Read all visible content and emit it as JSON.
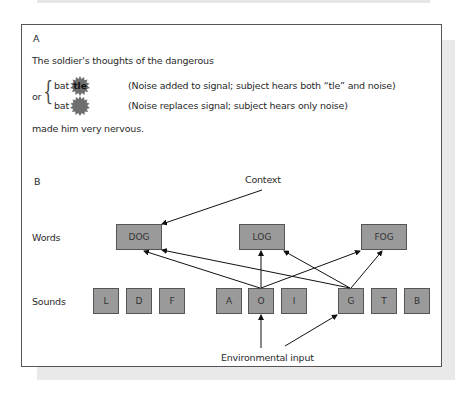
{
  "panel_a": {
    "label": "A",
    "sentence_start": "The soldier's thoughts of the dangerous",
    "or_label": "or",
    "options": [
      {
        "word_stem": "bat",
        "noise_text": "tle",
        "description": "(Noise added to signal; subject hears both “tle” and noise)"
      },
      {
        "word_stem": "bat",
        "noise_text": "",
        "description": "(Noise replaces signal; subject hears only noise)"
      }
    ],
    "sentence_end": "made him very nervous."
  },
  "panel_b": {
    "label": "B",
    "context_label": "Context",
    "words_row_label": "Words",
    "sounds_row_label": "Sounds",
    "input_label": "Environmental input",
    "words": [
      "DOG",
      "LOG",
      "FOG"
    ],
    "sounds": [
      "L",
      "D",
      "F",
      "A",
      "O",
      "I",
      "G",
      "T",
      "B"
    ],
    "connections": [
      {
        "from": "Context",
        "to": "DOG"
      },
      {
        "from": "O",
        "to": "DOG"
      },
      {
        "from": "O",
        "to": "LOG"
      },
      {
        "from": "O",
        "to": "FOG"
      },
      {
        "from": "G",
        "to": "DOG"
      },
      {
        "from": "G",
        "to": "LOG"
      },
      {
        "from": "G",
        "to": "FOG"
      },
      {
        "from": "Environmental input",
        "to": "O"
      },
      {
        "from": "Environmental input",
        "to": "G"
      }
    ]
  },
  "colors": {
    "box_fill": "#9a9a9a",
    "box_border": "#555555",
    "noise_fill": "#6e6e6e",
    "arrow": "#111111",
    "shadow": "#e9e9e9"
  }
}
